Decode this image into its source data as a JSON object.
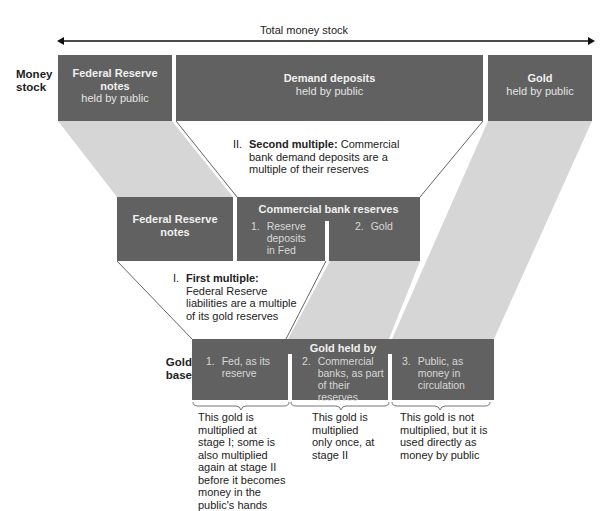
{
  "header": {
    "total_label": "Total money stock"
  },
  "row_labels": {
    "money_stock": "Money stock",
    "gold_base": "Gold base"
  },
  "top_row": {
    "fr_notes": {
      "title": "Federal Reserve notes",
      "sub": "held by public"
    },
    "demand_deposits": {
      "title": "Demand deposits",
      "sub": "held by public"
    },
    "gold_public": {
      "title": "Gold",
      "sub": "held by public"
    }
  },
  "second_multiple": {
    "numeral": "II.",
    "bold": "Second multiple:",
    "text": "Commercial bank demand deposits are a multiple of their reserves"
  },
  "middle_row": {
    "fr_notes": {
      "title": "Federal Reserve notes"
    },
    "bank_reserves": {
      "title": "Commercial bank reserves",
      "items": [
        {
          "num": "1.",
          "text": "Reserve deposits in Fed"
        },
        {
          "num": "2.",
          "text": "Gold"
        }
      ]
    }
  },
  "first_multiple": {
    "numeral": "I.",
    "bold": "First multiple:",
    "text": "Federal Reserve liabilities are a multiple of its gold reserves"
  },
  "bottom_row": {
    "title": "Gold held by",
    "items": [
      {
        "num": "1.",
        "text": "Fed, as its reserve"
      },
      {
        "num": "2.",
        "text": "Commercial banks, as part of their reserves"
      },
      {
        "num": "3.",
        "text": "Public, as money in circulation"
      }
    ]
  },
  "footnotes": [
    "This gold is multiplied at stage I; some is also multiplied again at stage II before it becomes money in the public's hands",
    "This gold is multiplied only once, at stage II",
    "This gold is not multiplied, but it is used directly as money by public"
  ],
  "colors": {
    "box": "#616161",
    "flow": "#d6d6d6",
    "line": "#555555"
  }
}
